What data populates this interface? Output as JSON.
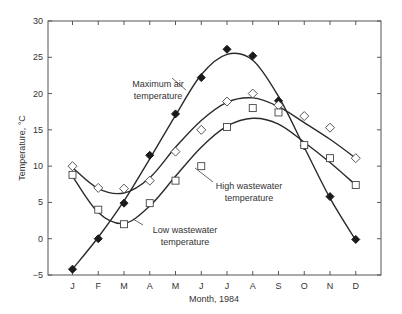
{
  "chart_data": {
    "type": "scatter",
    "title": "",
    "xlabel": "Month, 1984",
    "ylabel": "Temperature, °C",
    "categories": [
      "J",
      "F",
      "M",
      "A",
      "M",
      "J",
      "J",
      "A",
      "S",
      "O",
      "N",
      "D"
    ],
    "ylim": [
      -5,
      30
    ],
    "yticks": [
      -5,
      0,
      5,
      10,
      15,
      20,
      25,
      30
    ],
    "grid": false,
    "legend": "none (inline annotations)",
    "series": [
      {
        "name": "Maximum air temperature",
        "marker": "filled-diamond",
        "values": [
          -4.2,
          0.0,
          4.9,
          11.5,
          17.2,
          22.2,
          26.1,
          25.2,
          19.0,
          12.8,
          5.8,
          -0.1
        ]
      },
      {
        "name": "High wastewater temperature",
        "marker": "open-diamond",
        "values": [
          10.0,
          7.0,
          6.9,
          8.0,
          12.0,
          15.0,
          18.9,
          20.0,
          18.4,
          16.9,
          15.3,
          11.1
        ]
      },
      {
        "name": "Low wastewater temperature",
        "marker": "open-square",
        "values": [
          8.8,
          4.0,
          2.0,
          4.9,
          8.0,
          10.0,
          15.4,
          18.0,
          17.4,
          12.9,
          11.1,
          7.4
        ]
      }
    ],
    "annotations": [
      {
        "text": [
          "Maximum air",
          "temperature"
        ],
        "points_to": "Maximum air temperature"
      },
      {
        "text": [
          "High wastewater",
          "temperature"
        ],
        "points_to": "High wastewater temperature"
      },
      {
        "text": [
          "Low wastewater",
          "temperature"
        ],
        "points_to": "Low wastewater temperature"
      }
    ]
  }
}
